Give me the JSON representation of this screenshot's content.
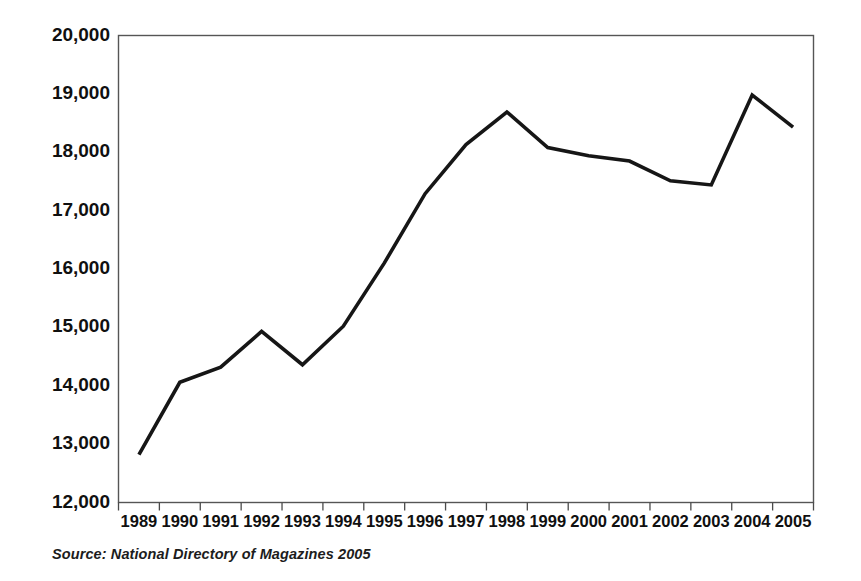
{
  "figure": {
    "source_note": "Source: National Directory of Magazines 2005",
    "line_color": "#161616",
    "frame_color": "#555555",
    "background_color": "#ffffff"
  },
  "chart_data": {
    "type": "line",
    "title": "",
    "subtitle": "",
    "xlabel": "",
    "ylabel": "",
    "categories": [
      "1989",
      "1990",
      "1991",
      "1992",
      "1993",
      "1994",
      "1995",
      "1996",
      "1997",
      "1998",
      "1999",
      "2000",
      "2001",
      "2002",
      "2003",
      "2004",
      "2005"
    ],
    "values": [
      12820,
      14060,
      14320,
      14930,
      14360,
      15020,
      16100,
      17290,
      18130,
      18690,
      18080,
      17940,
      17850,
      17510,
      17440,
      18980,
      18430
    ],
    "series": [
      {
        "name": "Number of magazines",
        "values": [
          12820,
          14060,
          14320,
          14930,
          14360,
          15020,
          16100,
          17290,
          18130,
          18690,
          18080,
          17940,
          17850,
          17510,
          17440,
          18980,
          18430
        ]
      }
    ],
    "ylim": [
      12000,
      20000
    ],
    "ytick_values": [
      20000,
      19000,
      18000,
      17000,
      16000,
      15000,
      14000,
      13000,
      12000
    ],
    "ytick_labels": [
      "20,000",
      "19,000",
      "18,000",
      "17,000",
      "16,000",
      "15,000",
      "14,000",
      "13,000",
      "12,000"
    ],
    "xtick_labels": [
      "1989",
      "1990",
      "1991",
      "1992",
      "1993",
      "1994",
      "1995",
      "1996",
      "1997",
      "1998",
      "1999",
      "2000",
      "2001",
      "2002",
      "2003",
      "2004",
      "2005"
    ],
    "grid": false,
    "legend": false,
    "legend_position": "none",
    "annotations": [
      "Source: National Directory of Magazines 2005"
    ]
  }
}
